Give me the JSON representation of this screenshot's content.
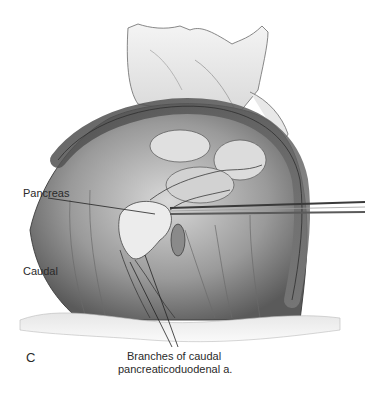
{
  "figure": {
    "panel_letter": "C",
    "labels": {
      "pancreas": "Pancreas",
      "caudal": "Caudal",
      "branches_line1": "Branches of caudal",
      "branches_line2": "pancreaticoduodenal a."
    },
    "colors": {
      "background": "#ffffff",
      "ink": "#2a2a2a",
      "tissue_dark": "#555555",
      "tissue_mid": "#8a8a8a",
      "tissue_light": "#c8c8c8"
    }
  }
}
